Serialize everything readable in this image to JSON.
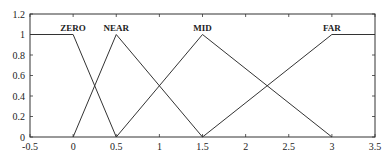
{
  "chart_data": {
    "type": "line",
    "title": "",
    "xlabel": "",
    "ylabel": "",
    "xlim": [
      -0.5,
      3.5
    ],
    "ylim": [
      0,
      1.2
    ],
    "grid": false,
    "legend": "none (labels placed at membership peaks)",
    "xticks": [
      "-0.5",
      "0",
      "0.5",
      "1",
      "1.5",
      "2",
      "2.5",
      "3",
      "3.5"
    ],
    "xtick_values": [
      -0.5,
      0,
      0.5,
      1,
      1.5,
      2,
      2.5,
      3,
      3.5
    ],
    "yticks": [
      "0",
      "0.2",
      "0.4",
      "0.6",
      "0.8",
      "1",
      "1.2"
    ],
    "ytick_values": [
      0,
      0.2,
      0.4,
      0.6,
      0.8,
      1,
      1.2
    ],
    "series": [
      {
        "name": "ZERO",
        "x": [
          -0.5,
          0,
          0.5
        ],
        "y": [
          1,
          1,
          0
        ],
        "label_at": [
          0,
          1
        ]
      },
      {
        "name": "NEAR",
        "x": [
          0,
          0.5,
          1.5
        ],
        "y": [
          0,
          1,
          0
        ],
        "label_at": [
          0.5,
          1
        ]
      },
      {
        "name": "MID",
        "x": [
          0.5,
          1.5,
          3
        ],
        "y": [
          0,
          1,
          0
        ],
        "label_at": [
          1.5,
          1
        ]
      },
      {
        "name": "FAR",
        "x": [
          1.5,
          3,
          3.5
        ],
        "y": [
          0,
          1,
          1
        ],
        "label_at": [
          3,
          1
        ]
      }
    ],
    "line_color": "#333333"
  }
}
